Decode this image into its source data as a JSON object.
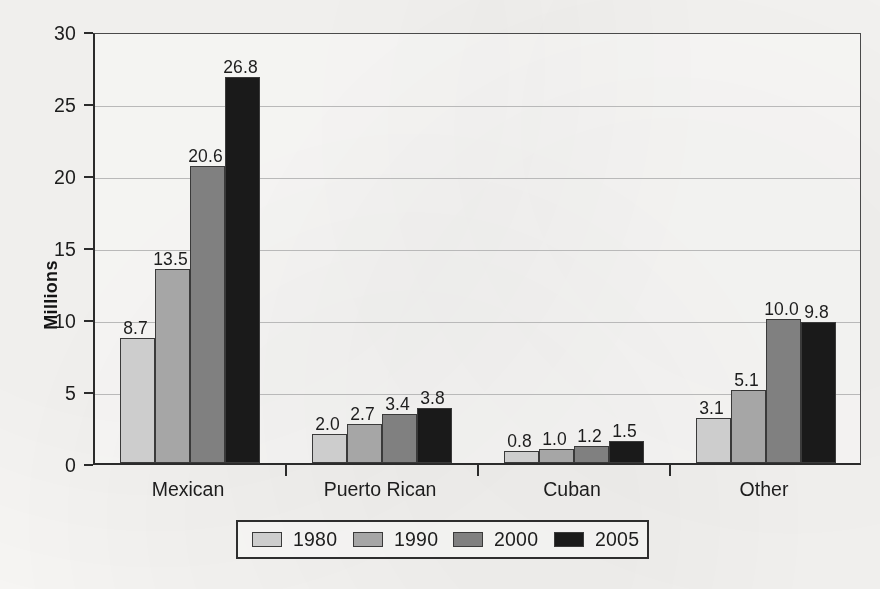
{
  "chart_data": {
    "type": "bar",
    "title": "",
    "xlabel": "",
    "ylabel": "Millions",
    "ylim": [
      0,
      30
    ],
    "ytick_values": [
      0,
      5,
      10,
      15,
      20,
      25,
      30
    ],
    "ytick_labels": [
      "0",
      "5",
      "10",
      "15",
      "20",
      "25",
      "30"
    ],
    "grid": true,
    "legend_position": "bottom",
    "categories": [
      "Mexican",
      "Puerto Rican",
      "Cuban",
      "Other"
    ],
    "series": [
      {
        "name": "1980",
        "color": "#cdcdcd",
        "values": [
          8.7,
          2.0,
          0.8,
          3.1
        ],
        "labels": [
          "8.7",
          "2.0",
          "0.8",
          "3.1"
        ]
      },
      {
        "name": "1990",
        "color": "#a6a6a6",
        "values": [
          13.5,
          2.7,
          1.0,
          5.1
        ],
        "labels": [
          "13.5",
          "2.7",
          "1.0",
          "5.1"
        ]
      },
      {
        "name": "2000",
        "color": "#808080",
        "values": [
          20.6,
          3.4,
          1.2,
          10.0
        ],
        "labels": [
          "20.6",
          "3.4",
          "1.2",
          "10.0"
        ]
      },
      {
        "name": "2005",
        "color": "#1a1a1a",
        "values": [
          26.8,
          3.8,
          1.5,
          9.8
        ],
        "labels": [
          "26.8",
          "3.8",
          "1.5",
          "9.8"
        ]
      }
    ]
  },
  "legend": {
    "entries": [
      {
        "label": "1980",
        "color": "#cdcdcd"
      },
      {
        "label": "1990",
        "color": "#a6a6a6"
      },
      {
        "label": "2000",
        "color": "#808080"
      },
      {
        "label": "2005",
        "color": "#1a1a1a"
      }
    ]
  }
}
